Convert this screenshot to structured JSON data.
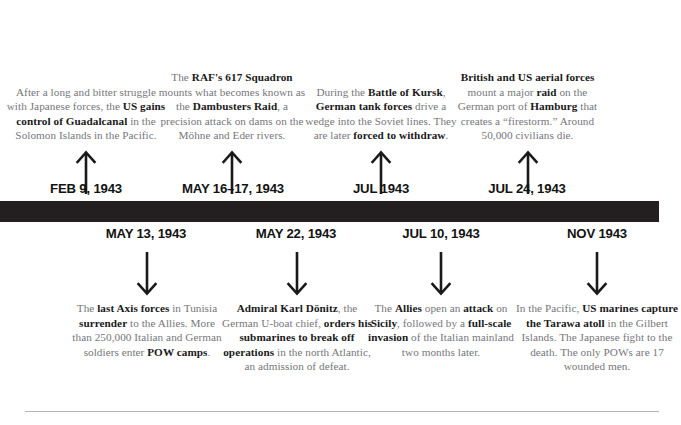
{
  "graphic": {
    "title": "World War II 1943 Timeline",
    "orientation": "horizontal",
    "bar_color": "#231f20",
    "body_text_color": "#76767a",
    "emphasis_text_color": "#1a1a1a"
  },
  "events_above": [
    {
      "date": "FEB 9, 1943",
      "arrow": "arrow-up-icon",
      "center_x": 86,
      "text_segments": [
        {
          "text": "After a long and bitter struggle with Japanese forces, the ",
          "bold": false
        },
        {
          "text": "US gains control of Guadalcanal",
          "bold": true
        },
        {
          "text": " in the Solomon Islands in the Pacific.",
          "bold": false
        }
      ]
    },
    {
      "date": "MAY 16–17, 1943",
      "arrow": "arrow-up-icon",
      "center_x": 231,
      "text_segments": [
        {
          "text": "The ",
          "bold": false
        },
        {
          "text": "RAF's 617 Squadron",
          "bold": true
        },
        {
          "text": " mounts what becomes known as the ",
          "bold": false
        },
        {
          "text": "Dambusters Raid",
          "bold": true
        },
        {
          "text": ", a precision attack on dams on the Möhne and Eder rivers.",
          "bold": false
        }
      ]
    },
    {
      "date": "JUL 1943",
      "arrow": "arrow-up-icon",
      "center_x": 381,
      "text_segments": [
        {
          "text": "During the ",
          "bold": false
        },
        {
          "text": "Battle of Kursk",
          "bold": true
        },
        {
          "text": ", ",
          "bold": false
        },
        {
          "text": "German tank forces",
          "bold": true
        },
        {
          "text": " drive a wedge into the Soviet lines. They are later ",
          "bold": false
        },
        {
          "text": "forced to withdraw",
          "bold": true
        },
        {
          "text": ".",
          "bold": false
        }
      ]
    },
    {
      "date": "JUL 24, 1943",
      "arrow": "arrow-up-icon",
      "center_x": 527,
      "text_segments": [
        {
          "text": "British and US aerial forces",
          "bold": true
        },
        {
          "text": " mount a major ",
          "bold": false
        },
        {
          "text": "raid",
          "bold": true
        },
        {
          "text": " on the German port of ",
          "bold": false
        },
        {
          "text": "Hamburg",
          "bold": true
        },
        {
          "text": " that creates a “firestorm.” Around 50,000 civilians die.",
          "bold": false
        }
      ]
    }
  ],
  "events_below": [
    {
      "date": "MAY 13, 1943",
      "arrow": "arrow-down-icon",
      "center_x": 146,
      "text_segments": [
        {
          "text": "The ",
          "bold": false
        },
        {
          "text": "last Axis forces",
          "bold": true
        },
        {
          "text": " in Tunisia ",
          "bold": false
        },
        {
          "text": "surrender",
          "bold": true
        },
        {
          "text": " to the Allies. More than 250,000 Italian and German soldiers enter ",
          "bold": false
        },
        {
          "text": "POW camps",
          "bold": true
        },
        {
          "text": ".",
          "bold": false
        }
      ]
    },
    {
      "date": "MAY 22, 1943",
      "arrow": "arrow-down-icon",
      "center_x": 296,
      "text_segments": [
        {
          "text": "Admiral Karl Dönitz",
          "bold": true
        },
        {
          "text": ", the German U-boat chief, ",
          "bold": false
        },
        {
          "text": "orders his submarines to break off operations",
          "bold": true
        },
        {
          "text": " in the north Atlantic, an admission of defeat.",
          "bold": false
        }
      ]
    },
    {
      "date": "JUL 10, 1943",
      "arrow": "arrow-down-icon",
      "center_x": 441,
      "text_segments": [
        {
          "text": "The ",
          "bold": false
        },
        {
          "text": "Allies",
          "bold": true
        },
        {
          "text": " open an ",
          "bold": false
        },
        {
          "text": "attack",
          "bold": true
        },
        {
          "text": " on ",
          "bold": false
        },
        {
          "text": "Sicily",
          "bold": true
        },
        {
          "text": ", followed by a ",
          "bold": false
        },
        {
          "text": "full-scale invasion",
          "bold": true
        },
        {
          "text": " of the Italian mainland two months later.",
          "bold": false
        }
      ]
    },
    {
      "date": "NOV 1943",
      "arrow": "arrow-down-icon",
      "center_x": 597,
      "text_segments": [
        {
          "text": "In the Pacific, ",
          "bold": false
        },
        {
          "text": "US marines capture the Tarawa atoll",
          "bold": true
        },
        {
          "text": " in the Gilbert Islands. The Japanese fight to the death. The only POWs are 17 wounded men.",
          "bold": false
        }
      ]
    }
  ]
}
